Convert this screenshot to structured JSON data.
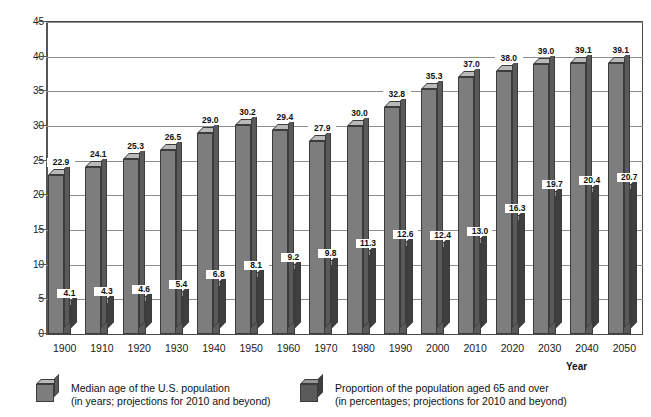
{
  "chart_data": {
    "type": "bar",
    "title": "",
    "xlabel": "Year",
    "ylabel": "",
    "ylim": [
      0,
      45
    ],
    "ytick_step": 5,
    "grid": true,
    "legend_position": "bottom",
    "categories": [
      "1900",
      "1910",
      "1920",
      "1930",
      "1940",
      "1950",
      "1960",
      "1970",
      "1980",
      "1990",
      "2000",
      "2010",
      "2020",
      "2030",
      "2040",
      "2050"
    ],
    "yticks": [
      "0",
      "5",
      "10",
      "15",
      "20",
      "25",
      "30",
      "35",
      "40",
      "45"
    ],
    "series": [
      {
        "name": "Median age of the U.S. population",
        "note": "(in years; projections for 2010 and beyond)",
        "color": "#7d7d7d",
        "values": [
          22.9,
          24.1,
          25.3,
          26.5,
          29.0,
          30.2,
          29.4,
          27.9,
          30.0,
          32.8,
          35.3,
          37.0,
          38.0,
          39.0,
          39.1,
          39.1
        ],
        "labels": [
          "22.9",
          "24.1",
          "25.3",
          "26.5",
          "29.0",
          "30.2",
          "29.4",
          "27.9",
          "30.0",
          "32.8",
          "35.3",
          "37.0",
          "38.0",
          "39.0",
          "39.1",
          "39.1"
        ]
      },
      {
        "name": "Proportion of the population aged 65 and over",
        "note": "(in percentages; projections for 2010 and beyond)",
        "color": "#5b5b5b",
        "values": [
          4.1,
          4.3,
          4.6,
          5.4,
          6.8,
          8.1,
          9.2,
          9.8,
          11.3,
          12.6,
          12.4,
          13.0,
          16.3,
          19.7,
          20.4,
          20.7
        ],
        "labels": [
          "4.1",
          "4.3",
          "4.6",
          "5.4",
          "6.8",
          "8.1",
          "9.2",
          "9.8",
          "11.3",
          "12.6",
          "12.4",
          "13.0",
          "16.3",
          "19.7",
          "20.4",
          "20.7"
        ]
      }
    ]
  },
  "axis": {
    "x_title": "Year"
  },
  "legend": {
    "items": [
      {
        "line1": "Median age of the U.S. population",
        "line2": "(in years; projections for 2010 and beyond)",
        "color": "#7d7d7d"
      },
      {
        "line1": "Proportion of the population aged 65 and over",
        "line2": "(in percentages; projections for 2010 and beyond)",
        "color": "#5b5b5b"
      }
    ]
  }
}
